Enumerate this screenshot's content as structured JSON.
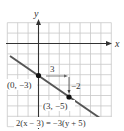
{
  "chart_data": {
    "type": "line",
    "title": "",
    "xlabel": "x",
    "ylabel": "y",
    "xlim": [
      -3,
      7
    ],
    "ylim": [
      -8,
      2
    ],
    "grid": true,
    "series": [
      {
        "name": "2(x - 3) = -3(y + 5)",
        "equation": "2(x − 3) = −3(y + 5)",
        "slope": -0.6667,
        "intercept": -3,
        "x": [
          -3,
          7
        ],
        "y": [
          -1,
          -7.667
        ]
      }
    ],
    "points": [
      {
        "label": "(0, −3)",
        "x": 0,
        "y": -3
      },
      {
        "label": "(3, −5)",
        "x": 3,
        "y": -5
      }
    ],
    "annotations": [
      {
        "text": "3",
        "meaning": "run",
        "from": [
          0,
          -3
        ],
        "to": [
          3,
          -3
        ]
      },
      {
        "text": "−2",
        "meaning": "rise",
        "from": [
          3,
          -3
        ],
        "to": [
          3,
          -5
        ]
      }
    ]
  },
  "labels": {
    "x_axis": "x",
    "y_axis": "y",
    "point1": "(0, −3)",
    "point2": "(3, −5)",
    "run": "3",
    "rise": "−2",
    "equation": "2(x − 3) = −3(y + 5)"
  },
  "colors": {
    "grid": "#c8c8c8",
    "axis": "#333333",
    "line": "#555555",
    "point": "#111111",
    "background": "#ffffff"
  }
}
